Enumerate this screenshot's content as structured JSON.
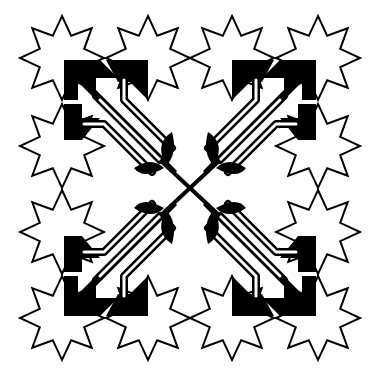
{
  "canvas": {
    "width": 380,
    "height": 376,
    "background": "#ffffff"
  },
  "colors": {
    "ink": "#000000",
    "fill_light": "#ffffff"
  },
  "stars": [
    {
      "cx": 62,
      "cy": 58
    },
    {
      "cx": 148,
      "cy": 58
    },
    {
      "cx": 62,
      "cy": 146
    },
    {
      "cx": 232,
      "cy": 58
    },
    {
      "cx": 318,
      "cy": 58
    },
    {
      "cx": 318,
      "cy": 146
    },
    {
      "cx": 62,
      "cy": 232
    },
    {
      "cx": 62,
      "cy": 318
    },
    {
      "cx": 148,
      "cy": 318
    },
    {
      "cx": 318,
      "cy": 232
    },
    {
      "cx": 318,
      "cy": 318
    },
    {
      "cx": 232,
      "cy": 318
    }
  ],
  "star_radius_outer": 42,
  "star_radius_inner": 24,
  "star_points": 8,
  "center": {
    "x": 190,
    "y": 188
  }
}
